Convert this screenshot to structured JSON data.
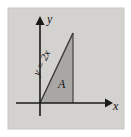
{
  "figure": {
    "panel": {
      "background_color": "#d4d2cf",
      "page_background_color": "#ffffff",
      "x": 8,
      "y": 8,
      "width": 116,
      "height": 121
    },
    "axes": {
      "x_axis": {
        "label": "x",
        "label_x": 115,
        "label_y": 107,
        "start_x": 16,
        "end_x": 112,
        "y": 103,
        "arrow": "right-arrow",
        "color": "#1a1a1a"
      },
      "y_axis": {
        "label": "y",
        "label_x": 47,
        "label_y": 21,
        "x": 40,
        "start_y": 116,
        "end_y": 17,
        "arrow": "up-arrow",
        "color": "#1a1a1a"
      }
    },
    "region": {
      "name": "shaded-triangle",
      "label": "A",
      "label_x": 62,
      "label_y": 86,
      "fill_color": "#a9a7a4",
      "stroke_color": "#4a4845",
      "vertices": "40,103 73,33 73,103"
    },
    "curve": {
      "equation_label": "y = 2x",
      "label_rotation_deg": -64,
      "label_x": 44,
      "label_y": 57,
      "from": "40,103",
      "to": "73,33",
      "color": "#3a3835"
    }
  }
}
